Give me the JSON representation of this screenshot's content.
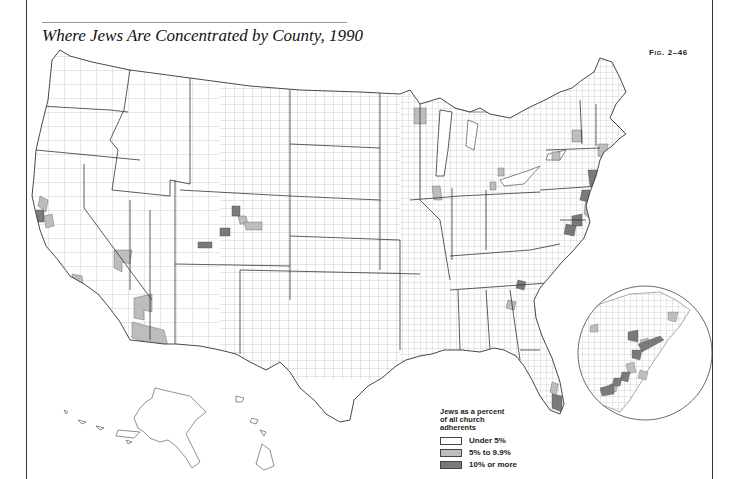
{
  "figure": {
    "title": "Where Jews Are Concentrated by County, 1990",
    "fig_label": "Fig. 2–46"
  },
  "legend": {
    "title_lines": [
      "Jews as a percent",
      "of all church",
      "adherents"
    ],
    "items": [
      {
        "label": "Under 5%",
        "color": "#ffffff"
      },
      {
        "label": "5% to 9.9%",
        "color": "#bdbdbd"
      },
      {
        "label": "10% or more",
        "color": "#7a7a7a"
      }
    ]
  },
  "map": {
    "type": "choropleth",
    "region": "United States counties",
    "inset": "Northeast corridor (Boston–Washington) enlarged circle",
    "highlighted_areas": [
      {
        "area": "New York City metro",
        "class": "10% or more"
      },
      {
        "area": "Northern New Jersey",
        "class": "10% or more"
      },
      {
        "area": "Philadelphia area",
        "class": "10% or more"
      },
      {
        "area": "Baltimore / Washington DC suburbs",
        "class": "10% or more"
      },
      {
        "area": "Southeast Florida (Miami–Palm Beach)",
        "class": "10% or more"
      },
      {
        "area": "San Francisco Bay area",
        "class": "10% or more"
      },
      {
        "area": "Denver area (Colorado)",
        "class": "10% or more"
      },
      {
        "area": "Boston area",
        "class": "5% to 9.9%"
      },
      {
        "area": "Los Angeles / Southern California",
        "class": "5% to 9.9%"
      },
      {
        "area": "Las Vegas (Clark County, NV)",
        "class": "5% to 9.9%"
      },
      {
        "area": "Phoenix / Tucson (Arizona)",
        "class": "5% to 9.9%"
      },
      {
        "area": "Chicago area",
        "class": "5% to 9.9%"
      },
      {
        "area": "Detroit area",
        "class": "5% to 9.9%"
      },
      {
        "area": "Northeastern Minnesota",
        "class": "5% to 9.9%"
      },
      {
        "area": "Atlanta area",
        "class": "10% or more"
      }
    ]
  },
  "colors": {
    "frame": "#333333",
    "state_border": "#333333",
    "county_border": "#8a8a8a"
  }
}
